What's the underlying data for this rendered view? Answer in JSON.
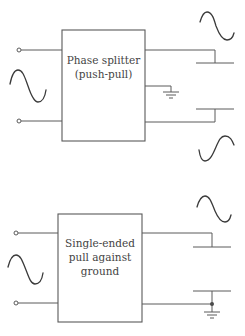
{
  "diagram": {
    "top_block": {
      "title_line1": "Phase splitter",
      "title_line2": "(push-pull)",
      "input_signal": "sine-wave",
      "outputs": [
        "sine-wave-in-phase",
        "sine-wave-inverted"
      ],
      "has_center_ground": true
    },
    "bottom_block": {
      "title_line1": "Single-ended",
      "title_line2": "pull against",
      "title_line3": "ground",
      "input_signal": "sine-wave",
      "outputs": [
        "sine-wave"
      ],
      "lower_plate_grounded": true
    },
    "colors": {
      "line": "#5a5a5a",
      "wave": "#3a3a3a",
      "text": "#444444",
      "background": "#ffffff"
    }
  }
}
